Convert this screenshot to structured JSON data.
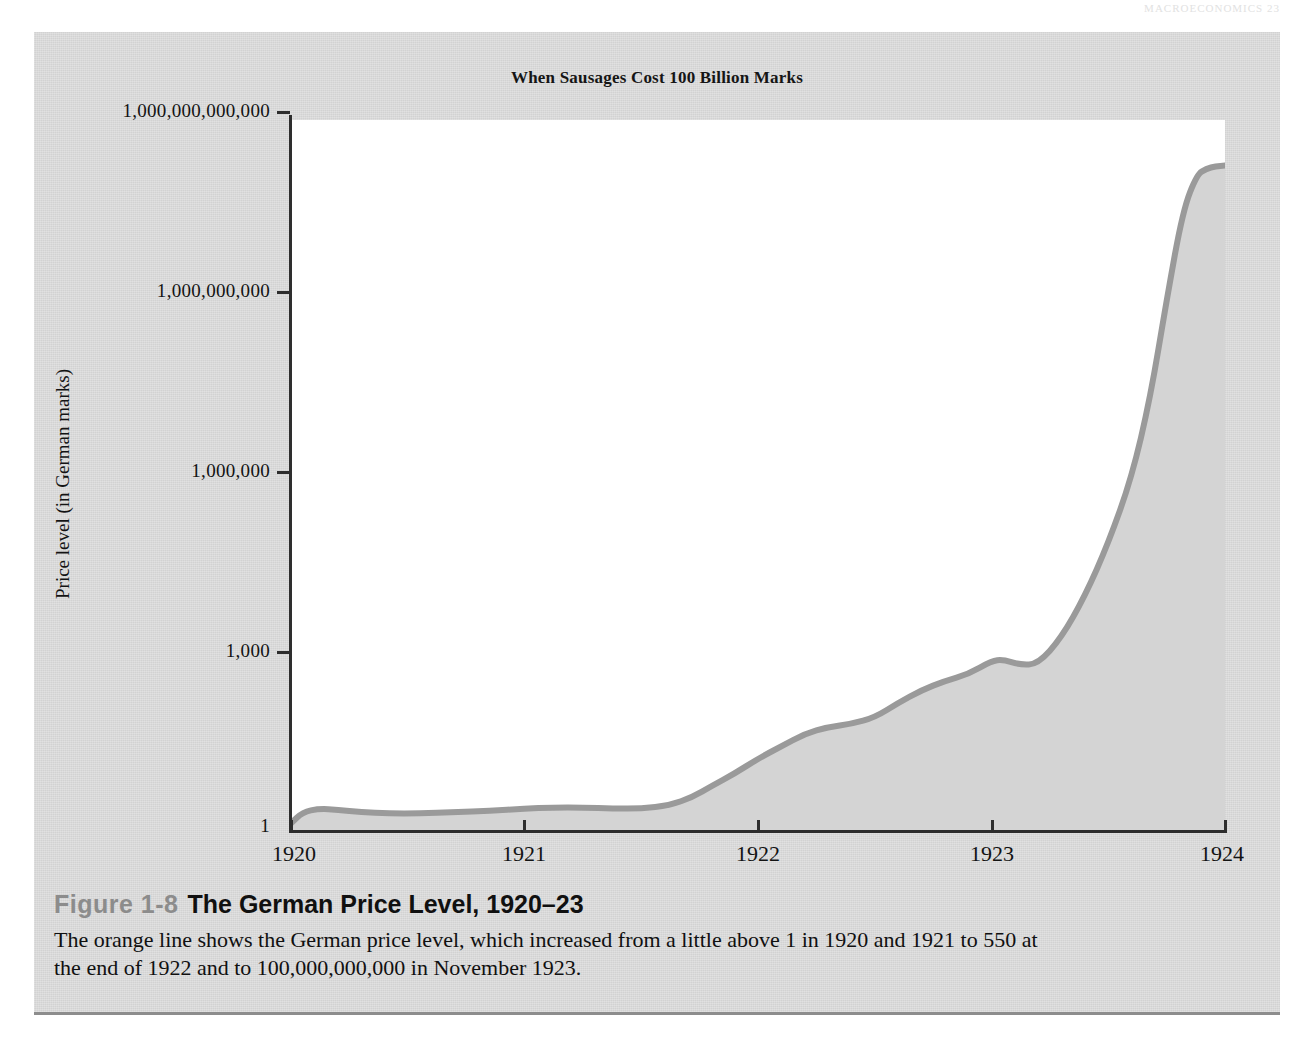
{
  "running_head": "MACROECONOMICS   23",
  "chart": {
    "title": "When Sausages Cost 100 Billion Marks",
    "y_axis_title": "Price level (in German marks)"
  },
  "caption": {
    "figure_number": "Figure 1-8",
    "figure_title": "The German Price Level, 1920–23",
    "body": "The orange line shows the German price level, which increased from a little above 1 in 1920 and 1921 to 550 at the end of 1922 and to 100,000,000,000 in November 1923."
  },
  "colors": {
    "figure_background": "#d2d2d2",
    "plot_background": "#ffffff",
    "line": "#9a9a9a",
    "fill": "#d4d4d4",
    "axis": "#2e2e2e",
    "caption_figno": "#8c8c8c"
  },
  "chart_data": {
    "type": "area",
    "title": "When Sausages Cost 100 Billion Marks",
    "xlabel": "",
    "ylabel": "Price level (in German marks)",
    "yscale": "log",
    "ylim": [
      1,
      1000000000000
    ],
    "xlim": [
      1920,
      1924
    ],
    "grid": false,
    "legend": null,
    "y_tick_labels": [
      "1",
      "1,000",
      "1,000,000",
      "1,000,000,000",
      "1,000,000,000,000"
    ],
    "y_tick_values": [
      1,
      1000,
      1000000,
      1000000000,
      1000000000000
    ],
    "x_tick_labels": [
      "1920",
      "1921",
      "1922",
      "1923",
      "1924"
    ],
    "x_tick_values": [
      1920,
      1921,
      1922,
      1923,
      1924
    ],
    "annotations": [
      "Price level a little above 1 in 1920 and 1921",
      "550 at the end of 1922",
      "100,000,000,000 in November 1923"
    ],
    "series": [
      {
        "name": "German price level",
        "x": [
          1920.0,
          1920.05,
          1920.12,
          1920.2,
          1920.3,
          1920.42,
          1920.55,
          1920.7,
          1920.85,
          1921.0,
          1921.12,
          1921.25,
          1921.38,
          1921.5,
          1921.62,
          1921.72,
          1921.8,
          1921.9,
          1922.0,
          1922.1,
          1922.2,
          1922.3,
          1922.4,
          1922.5,
          1922.6,
          1922.7,
          1922.8,
          1922.9,
          1923.0,
          1923.05,
          1923.12,
          1923.2,
          1923.3,
          1923.4,
          1923.5,
          1923.6,
          1923.68,
          1923.75,
          1923.82,
          1923.88,
          1923.92,
          1923.96,
          1924.0
        ],
        "y": [
          1.3,
          2.0,
          2.3,
          2.2,
          2.0,
          1.9,
          1.9,
          2.0,
          2.1,
          2.3,
          2.4,
          2.4,
          2.3,
          2.3,
          2.6,
          3.6,
          5.5,
          9.0,
          16.0,
          26.0,
          42.0,
          55.0,
          62.0,
          80.0,
          140.0,
          230.0,
          330.0,
          430.0,
          720.0,
          760.0,
          620.0,
          640.0,
          1800.0,
          9000.0,
          70000.0,
          900000.0,
          20000000.0,
          900000000.0,
          30000000000.0,
          120000000000.0,
          150000000000.0,
          165000000000.0,
          170000000000.0
        ]
      }
    ]
  }
}
